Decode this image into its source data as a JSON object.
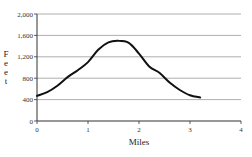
{
  "chart_data": {
    "type": "line",
    "title": "",
    "xlabel": "Miles",
    "ylabel": "Feet",
    "xlim": [
      0,
      4
    ],
    "ylim": [
      0,
      2000
    ],
    "x_ticks": [
      "0",
      "1",
      "2",
      "3",
      "4"
    ],
    "y_ticks": [
      "0",
      "400",
      "800",
      "1,200",
      "1,600",
      "2,000"
    ],
    "grid": "horizontal",
    "legend": "none",
    "series": [
      {
        "name": "Elevation",
        "x": [
          0,
          0.2,
          0.4,
          0.6,
          0.8,
          1.0,
          1.2,
          1.4,
          1.6,
          1.8,
          2.0,
          2.2,
          2.4,
          2.6,
          2.8,
          3.0,
          3.2
        ],
        "values": [
          470,
          540,
          660,
          820,
          950,
          1100,
          1330,
          1470,
          1500,
          1460,
          1260,
          1020,
          900,
          720,
          580,
          480,
          440
        ]
      }
    ]
  },
  "axes": {
    "xlabel": "Miles",
    "ylabel_letters": [
      "F",
      "e",
      "e",
      "t"
    ]
  }
}
